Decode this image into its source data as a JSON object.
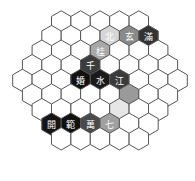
{
  "board": {
    "shape": "hexagon",
    "side": 5,
    "row_lengths": [
      5,
      6,
      7,
      8,
      9,
      8,
      7,
      6,
      5
    ],
    "hex_width": 19.4,
    "row_height": 14.6,
    "origin_y": 22,
    "center_x": 100,
    "stroke_color": "#555555",
    "empty_fill": "#ffffff"
  },
  "cells": [
    {
      "row": 1,
      "col": 3,
      "char": "北",
      "fill": "#d6d6d6",
      "text_color": "#ffffff"
    },
    {
      "row": 1,
      "col": 4,
      "char": "玄",
      "fill": "#8a8a8a",
      "text_color": "#ffffff"
    },
    {
      "row": 1,
      "col": 5,
      "char": "滿",
      "fill": "#333333",
      "text_color": "#ffffff"
    },
    {
      "row": 2,
      "col": 3,
      "char": "桂",
      "fill": "#a8a8a8",
      "text_color": "#ffffff"
    },
    {
      "row": 3,
      "col": 3,
      "char": "千",
      "fill": "#3c3c3c",
      "text_color": "#ffffff"
    },
    {
      "row": 4,
      "col": 3,
      "char": "婚",
      "fill": "#111111",
      "text_color": "#ffffff"
    },
    {
      "row": 4,
      "col": 4,
      "char": "水",
      "fill": "#1a1a1a",
      "text_color": "#ffffff"
    },
    {
      "row": 4,
      "col": 5,
      "char": "江",
      "fill": "#3a3a3a",
      "text_color": "#ffffff"
    },
    {
      "row": 5,
      "col": 5,
      "char": "",
      "fill": "#9a9a9a",
      "text_color": "#ffffff"
    },
    {
      "row": 6,
      "col": 4,
      "char": "",
      "fill": "#e6e6e6",
      "text_color": "#ffffff"
    },
    {
      "row": 7,
      "col": 0,
      "char": "開",
      "fill": "#151515",
      "text_color": "#ffffff"
    },
    {
      "row": 7,
      "col": 1,
      "char": "範",
      "fill": "#101010",
      "text_color": "#ffffff"
    },
    {
      "row": 7,
      "col": 2,
      "char": "萬",
      "fill": "#4a4a4a",
      "text_color": "#ffffff"
    },
    {
      "row": 7,
      "col": 3,
      "char": "七",
      "fill": "#a0a0a0",
      "text_color": "#ffffff"
    }
  ]
}
